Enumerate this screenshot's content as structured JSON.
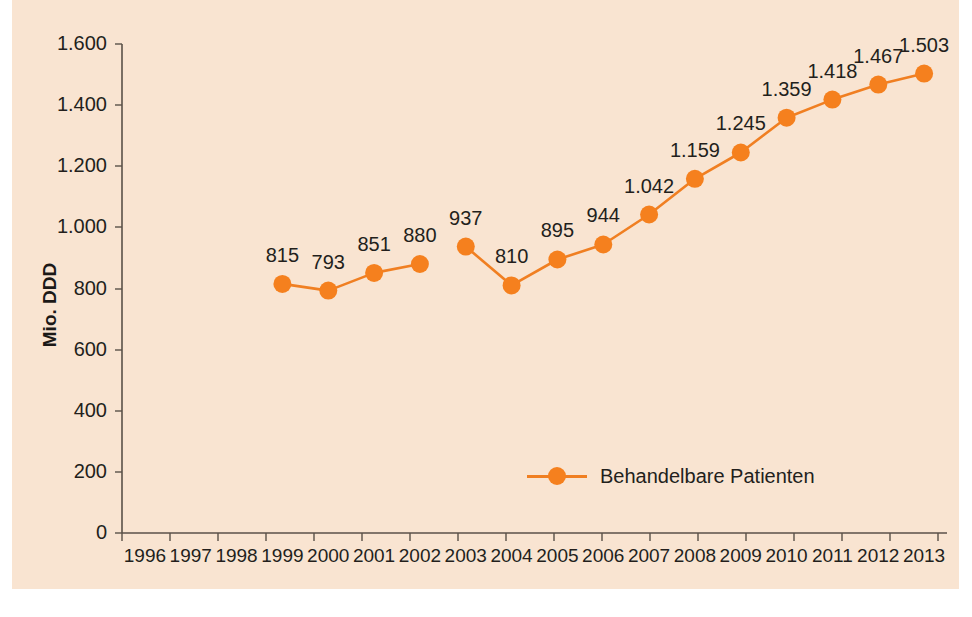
{
  "chart_data": {
    "type": "line",
    "title": "",
    "xlabel": "",
    "ylabel": "Mio. DDD",
    "ylim": [
      0,
      1600
    ],
    "grid": false,
    "legend_position": "inside-bottom-center",
    "legend_entries": [
      "Behandelbare Patienten"
    ],
    "axis_x_ticks": [
      "1996",
      "1997",
      "1998",
      "1999",
      "2000",
      "2001",
      "2002",
      "2003",
      "2004",
      "2005",
      "2006",
      "2007",
      "2008",
      "2009",
      "2010",
      "2011",
      "2012",
      "2013"
    ],
    "axis_y_ticks": [
      "0",
      "200",
      "400",
      "600",
      "800",
      "1.000",
      "1.200",
      "1.400",
      "1.600"
    ],
    "axis_y_tick_values": [
      0,
      200,
      400,
      600,
      800,
      1000,
      1200,
      1400,
      1600
    ],
    "series": [
      {
        "name": "Behandelbare Patienten",
        "color": "#f5801e",
        "x": [
          "1999",
          "2000",
          "2001",
          "2002",
          "2003",
          "2004",
          "2005",
          "2006",
          "2007",
          "2008",
          "2009",
          "2010",
          "2011",
          "2012",
          "2013"
        ],
        "values": [
          815,
          793,
          851,
          880,
          937,
          810,
          895,
          944,
          1042,
          1159,
          1245,
          1359,
          1418,
          1467,
          1503
        ],
        "labels": [
          "815",
          "793",
          "851",
          "880",
          "937",
          "810",
          "895",
          "944",
          "1.042",
          "1.159",
          "1.245",
          "1.359",
          "1.418",
          "1.467",
          "1.503"
        ],
        "break_after": "2002"
      }
    ],
    "missing_categories": [
      "1996",
      "1997",
      "1998"
    ]
  },
  "colors": {
    "panel_background": "#f9e4d1",
    "page_background": "#ffffff",
    "series_orange": "#f5801e",
    "line_orange": "#f07f22",
    "axis": "#5a5148",
    "text": "#231f1c"
  },
  "legend": {
    "label": "Behandelbare Patienten"
  },
  "axes": {
    "y_title": "Mio. DDD"
  }
}
